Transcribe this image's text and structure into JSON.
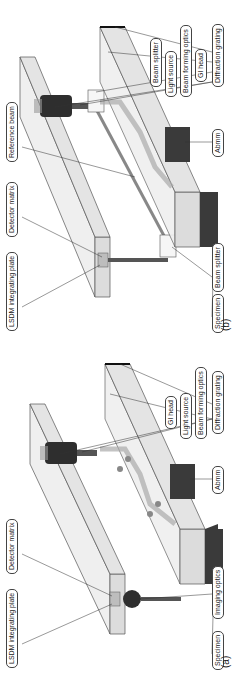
{
  "panels": [
    {
      "tag": "(a)",
      "labels": {
        "lsdm_plate": "LSDM integrating plate",
        "detector_matrix": "Detector matrix",
        "imaging_optics": "Imaging optics",
        "specimen": "Specimen",
        "light_source": "Light source",
        "beam_forming_optics": "Beam forming optics",
        "gi_head": "GI head",
        "diffraction_grating": "Diffraction grating",
        "abmm": "Abmm"
      }
    },
    {
      "tag": "(b)",
      "labels": {
        "lsdm_plate": "LSDM integrating plate",
        "detector_matrix": "Detector matrix",
        "reference_beam": "Reference beam",
        "beam_splitter_lower": "Beam splitter",
        "specimen": "Specimen",
        "light_source": "Light source",
        "beam_forming_optics": "Beam forming optics",
        "beam_splitter_upper": "Beam splitter",
        "gi_head": "GI head",
        "diffraction_grating": "Diffraction grating",
        "abmm": "Abmm"
      }
    }
  ],
  "colors": {
    "plate_fill": "#e8e8e8",
    "plate_stroke": "#555555",
    "dark_block": "#3a3a3a",
    "lens_dark": "#2e2e2e",
    "beam_gray": "#9a9a9a"
  }
}
